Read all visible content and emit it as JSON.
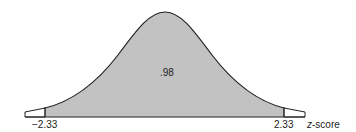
{
  "diagram": {
    "type": "normal-distribution",
    "center_label": ".98",
    "left_bound_label": "−2.33",
    "right_bound_label": "2.33",
    "axis_label_italic": "z",
    "axis_label_rest": "-score",
    "shaded_area": 0.98,
    "z_lower": -2.33,
    "z_upper": 2.33,
    "colors": {
      "shaded": "#c2c2c2",
      "tail": "#ffffff",
      "outline": "#222222"
    }
  }
}
